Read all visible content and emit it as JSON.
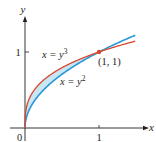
{
  "chart_data": {
    "type": "line",
    "title": "",
    "xlabel": "x",
    "ylabel": "y",
    "xlim": [
      0,
      1.5
    ],
    "ylim": [
      0,
      1.3
    ],
    "x_ticks": [
      {
        "value": 0,
        "label": "0"
      },
      {
        "value": 1,
        "label": "1"
      }
    ],
    "y_ticks": [
      {
        "value": 1,
        "label": "1"
      }
    ],
    "grid": false,
    "series": [
      {
        "name": "x = y^3",
        "equation": "y = x^(1/3)",
        "color": "#d9472b",
        "label_main": "x = y",
        "label_exp": "3"
      },
      {
        "name": "x = y^2",
        "equation": "y = x^(1/2)",
        "color": "#2a96d4",
        "label_main": "x = y",
        "label_exp": "2"
      }
    ],
    "shaded_region": {
      "between": [
        "x = y^3",
        "x = y^2"
      ],
      "x_range": [
        0,
        1
      ],
      "color": "#c9e6f5"
    },
    "annotations": [
      {
        "point": [
          1,
          1
        ],
        "label": "(1, 1)",
        "marker_color": "#d9472b"
      }
    ],
    "origin_label": "0"
  }
}
